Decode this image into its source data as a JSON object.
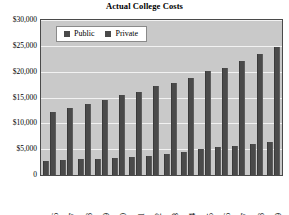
{
  "chart_data": {
    "type": "bar",
    "title": "Actual College Costs",
    "xlabel": "",
    "ylabel": "",
    "ylim": [
      0,
      30000
    ],
    "grid": true,
    "legend_position": "top-left",
    "categories": [
      "'95–'96",
      "'96–'97",
      "'97–'98",
      "'98–'99",
      "'99–'00",
      "'00–'01",
      "'01–'02",
      "'02–'03",
      "'03–'04",
      "'04–'05",
      "'05–'06",
      "'06–'07",
      "'07–'08",
      "'08–'09"
    ],
    "series": [
      {
        "name": "Public",
        "color": "#4a4a4a",
        "values": [
          2800,
          2950,
          3050,
          3150,
          3300,
          3450,
          3700,
          4000,
          4500,
          5000,
          5350,
          5650,
          5950,
          6300
        ]
      },
      {
        "name": "Private",
        "color": "#4a4a4a",
        "values": [
          12200,
          12900,
          13700,
          14600,
          15400,
          16000,
          17200,
          17900,
          18800,
          20100,
          20800,
          22000,
          23400,
          24800
        ]
      }
    ],
    "y_ticks": [
      {
        "value": 30000,
        "label": "$30,000"
      },
      {
        "value": 25000,
        "label": "$25,000"
      },
      {
        "value": 20000,
        "label": "$20,000"
      },
      {
        "value": 15000,
        "label": "$15,000"
      },
      {
        "value": 10000,
        "label": "$10,000"
      },
      {
        "value": 5000,
        "label": "$5,000"
      },
      {
        "value": 0,
        "label": "0"
      }
    ],
    "plot_background": "#c9c9c9",
    "gridline_color": "#f2f2f2",
    "axis_color": "#4a4a4a"
  }
}
